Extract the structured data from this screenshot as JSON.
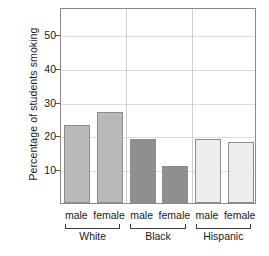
{
  "chart_data": {
    "type": "bar",
    "title": "",
    "xlabel": "",
    "ylabel": "Percentage of students smoking",
    "ylim": [
      0,
      58
    ],
    "yticks": [
      10,
      20,
      30,
      40,
      50
    ],
    "ytick_labels": [
      "10",
      "20",
      "30",
      "40",
      "50"
    ],
    "grid": true,
    "legend": "none",
    "categories": [
      "male",
      "female"
    ],
    "groups": [
      {
        "name": "White",
        "color": "#b9b9b9",
        "bars": [
          {
            "category": "male",
            "value": 23
          },
          {
            "category": "female",
            "value": 27
          }
        ]
      },
      {
        "name": "Black",
        "color": "#8f8f8f",
        "bars": [
          {
            "category": "male",
            "value": 19
          },
          {
            "category": "female",
            "value": 11
          }
        ]
      },
      {
        "name": "Hispanic",
        "color": "#ededed",
        "bars": [
          {
            "category": "male",
            "value": 19
          },
          {
            "category": "female",
            "value": 18
          }
        ]
      }
    ],
    "bar_edge_color": "#8c8c8c",
    "axis_color": "#8a8a8a",
    "grid_color": "#dcdcdc"
  }
}
